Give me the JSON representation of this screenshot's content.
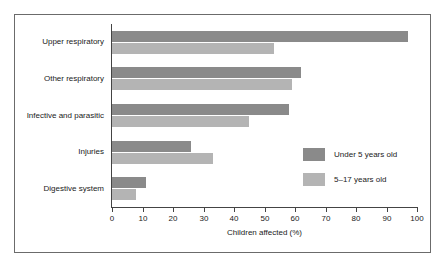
{
  "chart_data": {
    "type": "bar",
    "orientation": "horizontal",
    "title": "",
    "xlabel": "Children affected (%)",
    "ylabel": "",
    "xlim": [
      0,
      100
    ],
    "xticks": [
      0,
      10,
      20,
      30,
      40,
      50,
      60,
      70,
      80,
      90,
      100
    ],
    "grid": false,
    "legend_position": "right-middle",
    "categories": [
      "Upper respiratory",
      "Other respiratory",
      "Infective and parasitic",
      "Injuries",
      "Digestive system"
    ],
    "series": [
      {
        "name": "Under 5 years old",
        "color": "#8a8a8a",
        "values": [
          97,
          62,
          58,
          26,
          11
        ]
      },
      {
        "name": "5–17 years old",
        "color": "#b4b4b4",
        "values": [
          53,
          59,
          45,
          33,
          8
        ]
      }
    ]
  }
}
